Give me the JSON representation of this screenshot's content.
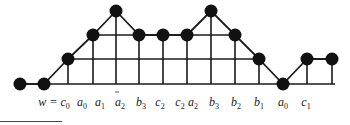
{
  "diagram": {
    "colors": {
      "stroke": "#1a1a1a",
      "node": "#111111"
    },
    "levels_y": [
      84,
      59,
      35,
      11
    ],
    "nodes": [
      {
        "x": 20,
        "level": 0
      },
      {
        "x": 44,
        "level": 0
      },
      {
        "x": 68,
        "level": 1
      },
      {
        "x": 93,
        "level": 2
      },
      {
        "x": 116,
        "level": 3
      },
      {
        "x": 139,
        "level": 2
      },
      {
        "x": 163,
        "level": 2
      },
      {
        "x": 187,
        "level": 2
      },
      {
        "x": 211,
        "level": 3
      },
      {
        "x": 235,
        "level": 2
      },
      {
        "x": 259,
        "level": 1
      },
      {
        "x": 283,
        "level": 0
      },
      {
        "x": 307,
        "level": 1
      },
      {
        "x": 332,
        "level": 1
      }
    ],
    "grid_lines": [
      {
        "level": 0,
        "x1": 20,
        "x2": 335
      },
      {
        "level": 1,
        "x1": 68,
        "x2": 259
      },
      {
        "level": 1,
        "x1": 307,
        "x2": 332
      },
      {
        "level": 2,
        "x1": 93,
        "x2": 235
      }
    ],
    "labels": [
      {
        "x": 54,
        "text": "w = c",
        "sub": "0"
      },
      {
        "x": 82,
        "text": "a",
        "sub": "0"
      },
      {
        "x": 100,
        "text": "a",
        "sub": "1"
      },
      {
        "x": 120,
        "text": "a",
        "sub": "2"
      },
      {
        "x": 141,
        "text": "b",
        "sub": "3"
      },
      {
        "x": 160,
        "text": "c",
        "sub": "2"
      },
      {
        "x": 180,
        "text": "c",
        "sub": "2"
      },
      {
        "x": 193,
        "text": "a",
        "sub": "2"
      },
      {
        "x": 214,
        "text": "b",
        "sub": "3"
      },
      {
        "x": 236,
        "text": "b",
        "sub": "2"
      },
      {
        "x": 259,
        "text": "b",
        "sub": "1"
      },
      {
        "x": 283,
        "text": "a",
        "sub": "0"
      },
      {
        "x": 306,
        "text": "c",
        "sub": "1"
      }
    ]
  }
}
